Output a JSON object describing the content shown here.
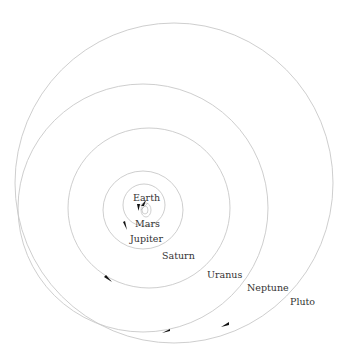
{
  "diagram": {
    "labels": {
      "earth": "Earth",
      "mars": "Mars",
      "jupiter": "Jupiter",
      "saturn": "Saturn",
      "uranus": "Uranus",
      "neptune": "Neptune",
      "pluto": "Pluto"
    },
    "colors": {
      "background": "#ffffff",
      "orbit_line": "#c8c8c8",
      "arrow": "#111111",
      "label": "#333333"
    }
  }
}
